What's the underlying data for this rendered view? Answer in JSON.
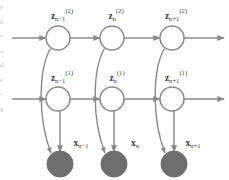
{
  "figure": {
    "name": "layered-hidden-markov-model",
    "caption": "",
    "colors": {
      "stroke": "#8a8a8a",
      "node_fill": "#ffffff",
      "observed_fill": "#6e6e6e",
      "text": "#3d3d3d",
      "background": "#ffffff"
    }
  },
  "margin_fragments": {
    "lines": [
      "e",
      "h",
      "s",
      "a",
      "d",
      "e",
      "-",
      "g"
    ]
  },
  "layers": {
    "top": {
      "name": "second-latent-chain",
      "superscript": "(2)",
      "nodes": [
        {
          "base": "z",
          "sub": "n−1",
          "sup": "(2)",
          "cx": 58,
          "cy": 38,
          "r": 12,
          "shaded": false
        },
        {
          "base": "z",
          "sub": "n",
          "sup": "(2)",
          "cx": 112,
          "cy": 38,
          "r": 12,
          "shaded": false
        },
        {
          "base": "z",
          "sub": "n+1",
          "sup": "(2)",
          "cx": 172,
          "cy": 38,
          "r": 12,
          "shaded": false
        }
      ]
    },
    "middle": {
      "name": "first-latent-chain",
      "superscript": "(1)",
      "nodes": [
        {
          "base": "z",
          "sub": "n−1",
          "sup": "(1)",
          "cx": 58,
          "cy": 99,
          "r": 12,
          "shaded": false
        },
        {
          "base": "z",
          "sub": "n",
          "sup": "(1)",
          "cx": 112,
          "cy": 99,
          "r": 12,
          "shaded": false
        },
        {
          "base": "z",
          "sub": "n+1",
          "sup": "(1)",
          "cx": 172,
          "cy": 99,
          "r": 12,
          "shaded": false
        }
      ]
    },
    "bottom": {
      "name": "observed-chain",
      "superscript": "",
      "nodes": [
        {
          "base": "x",
          "sub": "n−1",
          "sup": "",
          "cx": 60,
          "cy": 164,
          "r": 13,
          "shaded": true
        },
        {
          "base": "x",
          "sub": "n",
          "sup": "",
          "cx": 114,
          "cy": 164,
          "r": 13,
          "shaded": true
        },
        {
          "base": "x",
          "sub": "n+1",
          "sup": "",
          "cx": 174,
          "cy": 164,
          "r": 13,
          "shaded": true
        }
      ]
    }
  },
  "labels": {
    "top": [
      {
        "base": "z",
        "sub": "n−1",
        "sup": "(2)",
        "x": 62,
        "y": 19
      },
      {
        "base": "z",
        "sub": "n",
        "sup": "(2)",
        "x": 116,
        "y": 19
      },
      {
        "base": "z",
        "sub": "n+1",
        "sup": "(2)",
        "x": 176,
        "y": 19
      }
    ],
    "middle": [
      {
        "base": "z",
        "sub": "n−1",
        "sup": "(1)",
        "x": 62,
        "y": 81
      },
      {
        "base": "z",
        "sub": "n",
        "sup": "(1)",
        "x": 117,
        "y": 81
      },
      {
        "base": "z",
        "sub": "n+1",
        "sup": "(1)",
        "x": 176,
        "y": 81
      }
    ],
    "bottom": [
      {
        "base": "x",
        "sub": "n−1",
        "sup": "",
        "x": 81,
        "y": 146
      },
      {
        "base": "x",
        "sub": "n",
        "sup": "",
        "x": 135,
        "y": 146
      },
      {
        "base": "x",
        "sub": "n+1",
        "sup": "",
        "x": 193,
        "y": 146
      }
    ]
  },
  "edges": {
    "horizontal_top": [
      {
        "from_x": 12,
        "to_x": 46,
        "y": 38,
        "truncated_start": true
      },
      {
        "from_x": 70,
        "to_x": 100,
        "y": 38
      },
      {
        "from_x": 124,
        "to_x": 160,
        "y": 38
      },
      {
        "from_x": 184,
        "to_x": 222,
        "y": 38,
        "truncated_end": true
      }
    ],
    "horizontal_middle": [
      {
        "from_x": 12,
        "to_x": 46,
        "y": 99,
        "truncated_start": true
      },
      {
        "from_x": 70,
        "to_x": 100,
        "y": 99
      },
      {
        "from_x": 124,
        "to_x": 160,
        "y": 99
      },
      {
        "from_x": 184,
        "to_x": 222,
        "y": 99,
        "truncated_end": true
      }
    ],
    "vertical_to_observed": [
      {
        "x": 60,
        "from_y": 111,
        "to_y": 151
      },
      {
        "x": 114,
        "from_y": 111,
        "to_y": 151
      },
      {
        "x": 174,
        "from_y": 111,
        "to_y": 151
      }
    ],
    "curved_top_to_observed": [
      {
        "start_x": 50,
        "start_y": 48,
        "end_x": 52,
        "end_y": 156
      },
      {
        "start_x": 104,
        "start_y": 48,
        "end_x": 106,
        "end_y": 156
      },
      {
        "start_x": 164,
        "start_y": 48,
        "end_x": 166,
        "end_y": 156
      }
    ]
  }
}
